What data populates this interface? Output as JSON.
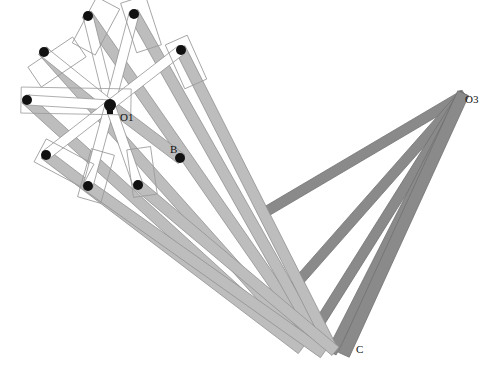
{
  "figure": {
    "kind": "kinematic-linkage-diagram",
    "title": "",
    "background_color": "#ffffff",
    "width": 486,
    "height": 375
  },
  "palette": {
    "bar_light_fill": "#bdbdbd",
    "bar_light_stroke": "#8f8f8f",
    "bar_dark_fill": "#8a8a8a",
    "bar_dark_stroke": "#6f6f6f",
    "frame_stroke": "#9a9a9a",
    "joint_fill": "#111111",
    "label_color": "#111111"
  },
  "labels": [
    {
      "id": "label-o1",
      "text": "O1",
      "x": 120,
      "y": 121
    },
    {
      "id": "label-b",
      "text": "B",
      "x": 170,
      "y": 153
    },
    {
      "id": "label-o3",
      "text": "O3",
      "x": 465,
      "y": 103
    },
    {
      "id": "label-c",
      "text": "C",
      "x": 356,
      "y": 353
    }
  ],
  "hub": {
    "id": "hub-o1",
    "x": 110,
    "y": 105,
    "radius": 6
  },
  "joints": [
    {
      "id": "joint-top-1",
      "x": 88,
      "y": 16,
      "r": 5
    },
    {
      "id": "joint-top-2",
      "x": 134,
      "y": 14,
      "r": 5
    },
    {
      "id": "joint-right-upper",
      "x": 181,
      "y": 50,
      "r": 5
    },
    {
      "id": "joint-left-1",
      "x": 44,
      "y": 52,
      "r": 5
    },
    {
      "id": "joint-left-2",
      "x": 27,
      "y": 100,
      "r": 5
    },
    {
      "id": "joint-left-3",
      "x": 46,
      "y": 155,
      "r": 5
    },
    {
      "id": "joint-bottom-1",
      "x": 88,
      "y": 186,
      "r": 5
    },
    {
      "id": "joint-bottom-2",
      "x": 138,
      "y": 185,
      "r": 5
    },
    {
      "id": "joint-b",
      "x": 180,
      "y": 158,
      "r": 5
    }
  ],
  "light_bars": [
    {
      "id": "bar-light-1",
      "x1": 88,
      "y1": 16,
      "x2": 306,
      "y2": 330,
      "w": 11
    },
    {
      "id": "bar-light-2",
      "x1": 134,
      "y1": 14,
      "x2": 318,
      "y2": 340,
      "w": 11
    },
    {
      "id": "bar-light-3",
      "x1": 181,
      "y1": 50,
      "x2": 330,
      "y2": 345,
      "w": 11
    },
    {
      "id": "bar-light-4",
      "x1": 44,
      "y1": 52,
      "x2": 292,
      "y2": 330,
      "w": 11
    },
    {
      "id": "bar-light-5",
      "x1": 27,
      "y1": 100,
      "x2": 286,
      "y2": 336,
      "w": 11
    },
    {
      "id": "bar-light-6",
      "x1": 46,
      "y1": 155,
      "x2": 300,
      "y2": 348,
      "w": 11
    },
    {
      "id": "bar-light-7",
      "x1": 88,
      "y1": 186,
      "x2": 322,
      "y2": 352,
      "w": 11
    },
    {
      "id": "bar-light-8",
      "x1": 138,
      "y1": 185,
      "x2": 334,
      "y2": 350,
      "w": 11
    },
    {
      "id": "bar-light-9",
      "x1": 110,
      "y1": 105,
      "x2": 180,
      "y2": 158,
      "w": 11
    }
  ],
  "hub_bars": [
    {
      "id": "bar-hub-1",
      "x1": 110,
      "y1": 105,
      "x2": 88,
      "y2": 16,
      "w": 10
    },
    {
      "id": "bar-hub-2",
      "x1": 110,
      "y1": 105,
      "x2": 134,
      "y2": 14,
      "w": 10
    },
    {
      "id": "bar-hub-3",
      "x1": 110,
      "y1": 105,
      "x2": 181,
      "y2": 50,
      "w": 10
    },
    {
      "id": "bar-hub-4",
      "x1": 110,
      "y1": 105,
      "x2": 44,
      "y2": 52,
      "w": 10
    },
    {
      "id": "bar-hub-5",
      "x1": 110,
      "y1": 105,
      "x2": 27,
      "y2": 100,
      "w": 10
    },
    {
      "id": "bar-hub-6",
      "x1": 110,
      "y1": 105,
      "x2": 46,
      "y2": 155,
      "w": 10
    },
    {
      "id": "bar-hub-7",
      "x1": 110,
      "y1": 105,
      "x2": 88,
      "y2": 186,
      "w": 10
    },
    {
      "id": "bar-hub-8",
      "x1": 110,
      "y1": 105,
      "x2": 138,
      "y2": 185,
      "w": 10
    }
  ],
  "dark_bars": [
    {
      "id": "bar-dark-1",
      "x1": 462,
      "y1": 96,
      "x2": 262,
      "y2": 214,
      "w": 10
    },
    {
      "id": "bar-dark-2",
      "x1": 462,
      "y1": 96,
      "x2": 282,
      "y2": 300,
      "w": 10
    },
    {
      "id": "bar-dark-3",
      "x1": 462,
      "y1": 96,
      "x2": 310,
      "y2": 338,
      "w": 10
    },
    {
      "id": "bar-dark-4",
      "x1": 462,
      "y1": 96,
      "x2": 333,
      "y2": 350,
      "w": 10
    },
    {
      "id": "bar-dark-5",
      "x1": 462,
      "y1": 96,
      "x2": 345,
      "y2": 352,
      "w": 12
    }
  ],
  "frames": [
    {
      "id": "frame-top-1",
      "cx": 96,
      "cy": 26,
      "w": 26,
      "h": 52,
      "angle": 28
    },
    {
      "id": "frame-top-2",
      "cx": 141,
      "cy": 24,
      "w": 26,
      "h": 52,
      "angle": -18
    },
    {
      "id": "frame-right-upper",
      "cx": 186,
      "cy": 62,
      "w": 24,
      "h": 48,
      "angle": -24
    },
    {
      "id": "frame-left-1",
      "cx": 57,
      "cy": 62,
      "w": 24,
      "h": 54,
      "angle": 56
    },
    {
      "id": "frame-left-2",
      "cx": 76,
      "cy": 101,
      "w": 110,
      "h": 26,
      "angle": 1
    },
    {
      "id": "frame-left-3",
      "cx": 64,
      "cy": 163,
      "w": 26,
      "h": 54,
      "angle": 118
    },
    {
      "id": "frame-bottom-1",
      "cx": 96,
      "cy": 176,
      "w": 24,
      "h": 50,
      "angle": 16
    },
    {
      "id": "frame-bottom-2",
      "cx": 142,
      "cy": 172,
      "w": 24,
      "h": 48,
      "angle": -8
    }
  ]
}
